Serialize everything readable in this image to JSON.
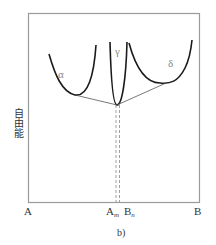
{
  "figure": {
    "caption": "b)",
    "y_axis_label": "自由能",
    "x_axis": {
      "left_label": "A",
      "right_label": "B",
      "marker_1": {
        "main": "A",
        "sub": "m"
      },
      "marker_2": {
        "main": "B",
        "sub": "n"
      }
    },
    "phases": [
      {
        "name": "alpha",
        "label": "α"
      },
      {
        "name": "gamma",
        "label": "γ"
      },
      {
        "name": "delta",
        "label": "δ"
      }
    ],
    "colors": {
      "frame": "#9a9a9a",
      "curve": "#1a1a1a",
      "tangent": "#555555",
      "dashed": "#888888",
      "phase_label": "#888888"
    }
  }
}
